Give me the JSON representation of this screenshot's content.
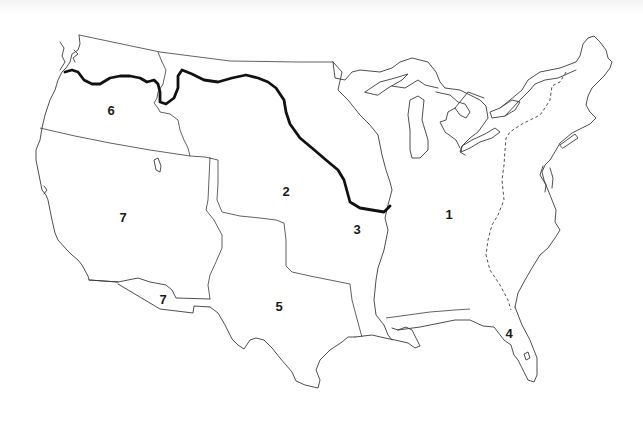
{
  "map": {
    "subject": "Contiguous United States territorial regions",
    "colors": {
      "background": "#ffffff",
      "outline": "#3a3a3a",
      "river": "#111111",
      "label": "#1a1a1a"
    },
    "regions": [
      {
        "id": "region-1",
        "label": "1",
        "x": 449,
        "y": 214
      },
      {
        "id": "region-2",
        "label": "2",
        "x": 286,
        "y": 191
      },
      {
        "id": "region-3",
        "label": "3",
        "x": 357,
        "y": 229
      },
      {
        "id": "region-4",
        "label": "4",
        "x": 509,
        "y": 333
      },
      {
        "id": "region-5",
        "label": "5",
        "x": 279,
        "y": 306
      },
      {
        "id": "region-6",
        "label": "6",
        "x": 111,
        "y": 110
      },
      {
        "id": "region-7a",
        "label": "7",
        "x": 123,
        "y": 217
      },
      {
        "id": "region-7b",
        "label": "7",
        "x": 163,
        "y": 299
      }
    ],
    "features": {
      "bold_line": "river boundary (Columbia–Snake–Missouri path)",
      "dashed_line": "eastern boundary line (Appalachian divide)"
    }
  }
}
